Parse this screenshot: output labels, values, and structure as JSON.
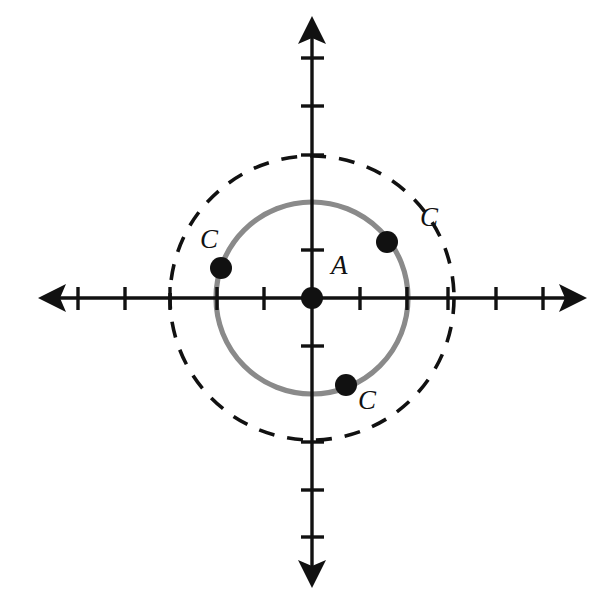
{
  "figure": {
    "background_color": "#ffffff",
    "width": 610,
    "height": 606
  },
  "axes": {
    "color": "#111111",
    "stroke_width": 3.2,
    "origin": {
      "x": 312,
      "y": 298
    },
    "unit_pixels": 47.5,
    "x_axis": {
      "name": "horizontal-axis",
      "left_arrow_tip_x": 38,
      "right_arrow_tip_x": 587,
      "y": 298,
      "tick_length": 22,
      "tick_positions_px": [
        78,
        117,
        165,
        216,
        264,
        360,
        408,
        448,
        496,
        543
      ],
      "visible_tick_positions_px": [
        78,
        125,
        170,
        217,
        264,
        360,
        407,
        448,
        496,
        543
      ]
    },
    "y_axis": {
      "name": "vertical-axis",
      "top_arrow_tip_y": 16,
      "bottom_arrow_tip_y": 588,
      "x": 312,
      "tick_length": 22,
      "tick_positions_px": [
        58,
        106,
        155,
        203,
        250,
        346,
        394,
        442,
        490,
        537
      ],
      "visible_tick_positions_px": [
        58,
        106,
        155,
        250,
        346,
        442,
        490,
        537
      ]
    }
  },
  "circles": [
    {
      "name": "solid-gray-circle",
      "style": "solid",
      "color": "#8a8a8a",
      "stroke_width": 5.2,
      "center": {
        "x": 312,
        "y": 298
      },
      "radius_px": 96,
      "radius_units": 2
    },
    {
      "name": "dashed-black-circle",
      "style": "dashed",
      "color": "#111111",
      "stroke_width": 3.6,
      "dash_pattern": "16 13",
      "center": {
        "x": 312,
        "y": 298
      },
      "radius_px": 142,
      "radius_units": 3
    }
  ],
  "points": [
    {
      "id": "center-point-a",
      "label": "A",
      "x": 312,
      "y": 298,
      "radius_px": 11,
      "color": "#111111",
      "label_x": 331,
      "label_y": 252
    },
    {
      "id": "point-c-left",
      "label": "C",
      "x": 221,
      "y": 268,
      "radius_px": 11,
      "color": "#111111",
      "label_x": 200,
      "label_y": 226
    },
    {
      "id": "point-c-upper-right",
      "label": "C",
      "x": 387,
      "y": 242,
      "radius_px": 11,
      "color": "#111111",
      "label_x": 420,
      "label_y": 204
    },
    {
      "id": "point-c-lower",
      "label": "C",
      "x": 346,
      "y": 385,
      "radius_px": 11,
      "color": "#111111",
      "label_x": 358,
      "label_y": 387
    }
  ]
}
